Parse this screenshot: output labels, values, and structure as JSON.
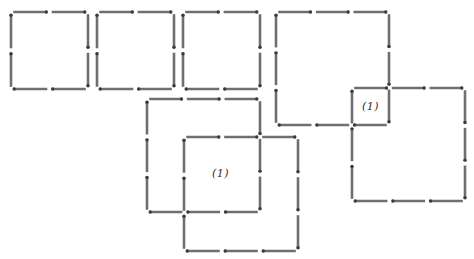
{
  "diagram": {
    "type": "matchstick-puzzle",
    "stick_color": "#6f6f6f",
    "head_color": "#3a3a3a",
    "background": "#ffffff",
    "squares": [
      {
        "id": "square-1",
        "x": 11,
        "y": 12,
        "size": 77,
        "sticks_per_side": 2
      },
      {
        "id": "square-2",
        "x": 97,
        "y": 12,
        "size": 77,
        "sticks_per_side": 2
      },
      {
        "id": "square-3",
        "x": 183,
        "y": 12,
        "size": 77,
        "sticks_per_side": 2
      },
      {
        "id": "large-square-top-right-a",
        "x": 276,
        "y": 12,
        "size": 113,
        "sticks_per_side": 3
      },
      {
        "id": "large-square-top-right-b",
        "x": 352,
        "y": 88,
        "size": 113,
        "sticks_per_side": 3
      },
      {
        "id": "large-square-bottom-a",
        "x": 147,
        "y": 99,
        "size": 113,
        "sticks_per_side": 3
      },
      {
        "id": "large-square-bottom-b",
        "x": 184,
        "y": 137,
        "size": 114,
        "sticks_per_side": 3
      }
    ],
    "labels": [
      {
        "id": "overlap-label-right",
        "text": "(1)",
        "x": 362,
        "y": 100
      },
      {
        "id": "overlap-label-bottom",
        "text": "(1)",
        "x": 212,
        "y": 167
      }
    ]
  }
}
